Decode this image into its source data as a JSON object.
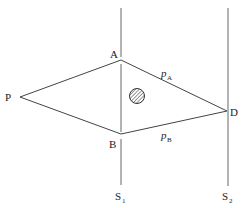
{
  "diagram": {
    "labels": {
      "A": "A",
      "B": "B",
      "P": "P",
      "D": "D",
      "pA_main": "p",
      "pA_sub": "A",
      "pB_main": "p",
      "pB_sub": "B",
      "S1_main": "S",
      "S1_sub": "1",
      "S2_main": "S",
      "S2_sub": "2"
    },
    "colors": {
      "line": "#555555",
      "text": "#222222"
    }
  }
}
